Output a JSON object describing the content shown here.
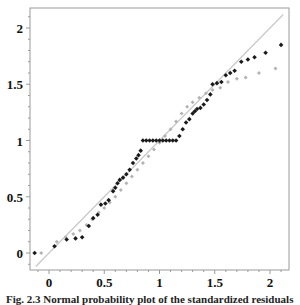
{
  "chart_data": {
    "type": "scatter",
    "title": "",
    "xlabel": "",
    "ylabel": "",
    "xlim": [
      -0.17,
      2.17
    ],
    "ylim": [
      -0.15,
      2.2
    ],
    "grid": false,
    "legend": null,
    "x_ticks": [
      "0",
      "0.5",
      "1",
      "1.5",
      "2"
    ],
    "y_ticks": [
      "0",
      "0.5",
      "1",
      "1.5",
      "2"
    ],
    "reference_line": {
      "label": "y = x",
      "from": [
        -0.12,
        -0.12
      ],
      "to": [
        2.12,
        2.12
      ],
      "color": "#c8c8c8"
    },
    "series": [
      {
        "name": "dark",
        "color": "#1a1a1a",
        "marker": "diamond",
        "points": [
          [
            -0.13,
            0.0
          ],
          [
            0.05,
            0.06
          ],
          [
            0.16,
            0.12
          ],
          [
            0.24,
            0.13
          ],
          [
            0.3,
            0.14
          ],
          [
            0.36,
            0.24
          ],
          [
            0.4,
            0.31
          ],
          [
            0.44,
            0.34
          ],
          [
            0.47,
            0.43
          ],
          [
            0.51,
            0.44
          ],
          [
            0.54,
            0.47
          ],
          [
            0.58,
            0.55
          ],
          [
            0.6,
            0.58
          ],
          [
            0.62,
            0.62
          ],
          [
            0.64,
            0.65
          ],
          [
            0.67,
            0.67
          ],
          [
            0.7,
            0.7
          ],
          [
            0.73,
            0.74
          ],
          [
            0.76,
            0.8
          ],
          [
            0.79,
            0.84
          ],
          [
            0.81,
            0.87
          ],
          [
            0.83,
            0.91
          ],
          [
            0.85,
            1.0
          ],
          [
            0.88,
            1.0
          ],
          [
            0.91,
            1.0
          ],
          [
            0.94,
            1.0
          ],
          [
            0.97,
            1.0
          ],
          [
            1.0,
            1.0
          ],
          [
            1.03,
            1.0
          ],
          [
            1.06,
            1.0
          ],
          [
            1.09,
            1.0
          ],
          [
            1.12,
            1.0
          ],
          [
            1.15,
            1.0
          ],
          [
            1.18,
            1.04
          ],
          [
            1.21,
            1.1
          ],
          [
            1.24,
            1.16
          ],
          [
            1.27,
            1.19
          ],
          [
            1.3,
            1.24
          ],
          [
            1.32,
            1.26
          ],
          [
            1.34,
            1.28
          ],
          [
            1.37,
            1.29
          ],
          [
            1.4,
            1.32
          ],
          [
            1.43,
            1.36
          ],
          [
            1.46,
            1.41
          ],
          [
            1.48,
            1.5
          ],
          [
            1.52,
            1.51
          ],
          [
            1.56,
            1.52
          ],
          [
            1.6,
            1.58
          ],
          [
            1.64,
            1.6
          ],
          [
            1.68,
            1.62
          ],
          [
            1.74,
            1.7
          ],
          [
            1.8,
            1.72
          ],
          [
            1.86,
            1.74
          ],
          [
            1.96,
            1.78
          ],
          [
            2.1,
            1.85
          ]
        ]
      },
      {
        "name": "light",
        "color": "#b4b4b4",
        "marker": "diamond",
        "points": [
          [
            -0.07,
            0.0
          ],
          [
            0.07,
            0.1
          ],
          [
            0.15,
            0.14
          ],
          [
            0.22,
            0.17
          ],
          [
            0.28,
            0.2
          ],
          [
            0.34,
            0.25
          ],
          [
            0.39,
            0.3
          ],
          [
            0.45,
            0.36
          ],
          [
            0.5,
            0.4
          ],
          [
            0.55,
            0.45
          ],
          [
            0.6,
            0.5
          ],
          [
            0.65,
            0.56
          ],
          [
            0.7,
            0.62
          ],
          [
            0.75,
            0.68
          ],
          [
            0.8,
            0.74
          ],
          [
            0.85,
            0.8
          ],
          [
            0.9,
            0.86
          ],
          [
            0.95,
            0.92
          ],
          [
            1.0,
            0.98
          ],
          [
            1.05,
            1.04
          ],
          [
            1.1,
            1.1
          ],
          [
            1.15,
            1.17
          ],
          [
            1.2,
            1.24
          ],
          [
            1.25,
            1.3
          ],
          [
            1.3,
            1.34
          ],
          [
            1.36,
            1.38
          ],
          [
            1.42,
            1.42
          ],
          [
            1.48,
            1.45
          ],
          [
            1.55,
            1.47
          ],
          [
            1.62,
            1.52
          ],
          [
            1.7,
            1.55
          ],
          [
            1.78,
            1.56
          ],
          [
            1.9,
            1.6
          ],
          [
            2.05,
            1.64
          ]
        ]
      }
    ]
  },
  "caption": "Fig. 2.3 Normal probability plot of the standardized residuals"
}
